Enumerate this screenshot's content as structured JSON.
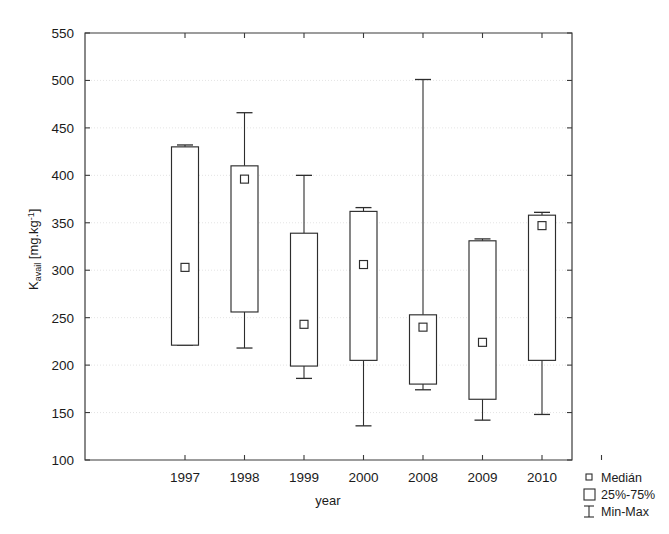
{
  "chart_data": {
    "type": "box",
    "title": "",
    "xlabel": "year",
    "ylabel": "K_avail [mg.kg-1]",
    "ylabel_parts": {
      "base": "K",
      "sub": "avail",
      "unit_open": " [mg.kg",
      "unit_sup": "-1",
      "unit_close": "]"
    },
    "categories": [
      "1997",
      "1998",
      "1999",
      "2000",
      "2008",
      "2009",
      "2010"
    ],
    "ylim": [
      100,
      550
    ],
    "yticks": [
      100,
      150,
      200,
      250,
      300,
      350,
      400,
      450,
      500,
      550
    ],
    "grid": true,
    "legend_position": "bottom-right",
    "legend": [
      {
        "key": "median",
        "label": "Medián",
        "glyph": "small-square"
      },
      {
        "key": "box",
        "label": "25%-75%",
        "glyph": "large-square"
      },
      {
        "key": "whisker",
        "label": "Min-Max",
        "glyph": "i-bar"
      }
    ],
    "boxes": [
      {
        "category": "1997",
        "min": 221,
        "q1": 221,
        "median": 303,
        "q3": 430,
        "max": 432
      },
      {
        "category": "1998",
        "min": 218,
        "q1": 256,
        "median": 396,
        "q3": 410,
        "max": 466
      },
      {
        "category": "1999",
        "min": 186,
        "q1": 199,
        "median": 243,
        "q3": 339,
        "max": 400
      },
      {
        "category": "2000",
        "min": 136,
        "q1": 205,
        "median": 306,
        "q3": 362,
        "max": 366
      },
      {
        "category": "2008",
        "min": 174,
        "q1": 180,
        "median": 240,
        "q3": 253,
        "max": 501
      },
      {
        "category": "2009",
        "min": 142,
        "q1": 164,
        "median": 224,
        "q3": 331,
        "max": 333
      },
      {
        "category": "2010",
        "min": 148,
        "q1": 205,
        "median": 347,
        "q3": 358,
        "max": 361
      }
    ]
  }
}
